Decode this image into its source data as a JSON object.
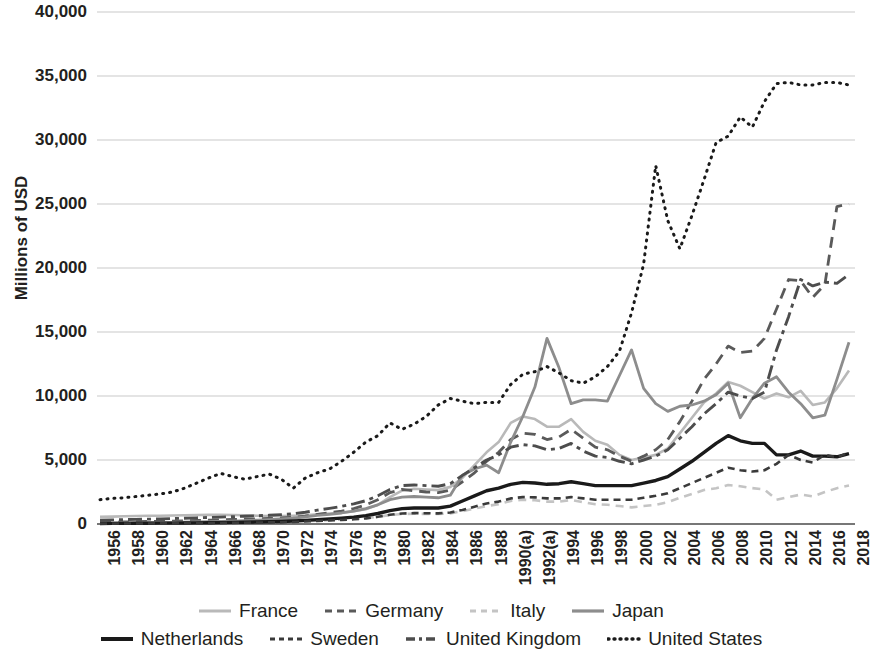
{
  "chart_data": {
    "type": "line",
    "title": "",
    "subtitle": "",
    "xlabel": "",
    "ylabel": "Millions of USD",
    "grid": true,
    "legend_position": "bottom",
    "ylim": [
      0,
      40000
    ],
    "ytick_step": 5000,
    "ytick_labels": [
      "40,000",
      "35,000",
      "30,000",
      "25,000",
      "20,000",
      "15,000",
      "10,000",
      "5,000",
      "0"
    ],
    "ytick_values": [
      40000,
      35000,
      30000,
      25000,
      20000,
      15000,
      10000,
      5000,
      0
    ],
    "x": [
      1956,
      1957,
      1958,
      1959,
      1960,
      1961,
      1962,
      1963,
      1964,
      1965,
      1966,
      1967,
      1968,
      1969,
      1970,
      1971,
      1972,
      1973,
      1974,
      1975,
      1976,
      1977,
      1978,
      1979,
      1980,
      1981,
      1982,
      1983,
      1984,
      1985,
      1986,
      1987,
      1988,
      1989,
      1990,
      1991,
      1992,
      1993,
      1994,
      1995,
      1996,
      1997,
      1998,
      1999,
      2000,
      2001,
      2002,
      2003,
      2004,
      2005,
      2006,
      2007,
      2008,
      2009,
      2010,
      2011,
      2012,
      2013,
      2014,
      2015,
      2016,
      2017,
      2018
    ],
    "xtick_labels": [
      "1956",
      "1958",
      "1960",
      "1962",
      "1964",
      "1966",
      "1968",
      "1970",
      "1972",
      "1974",
      "1976",
      "1978",
      "1980",
      "1982",
      "1984",
      "1986",
      "1988",
      "1990(a)",
      "1992(a)",
      "1994",
      "1996",
      "1998",
      "2000",
      "2002",
      "2004",
      "2006",
      "2008",
      "2010",
      "2012",
      "2014",
      "2016",
      "2018"
    ],
    "xtick_values": [
      1956,
      1958,
      1960,
      1962,
      1964,
      1966,
      1968,
      1970,
      1972,
      1974,
      1976,
      1978,
      1980,
      1982,
      1984,
      1986,
      1988,
      1990,
      1992,
      1994,
      1996,
      1998,
      2000,
      2002,
      2004,
      2006,
      2008,
      2010,
      2012,
      2014,
      2016,
      2018
    ],
    "series": [
      {
        "name": "France",
        "color": "#b9b9b9",
        "width": 2.6,
        "dash": "none",
        "values": [
          560,
          580,
          600,
          620,
          640,
          650,
          660,
          680,
          700,
          710,
          720,
          700,
          680,
          650,
          630,
          620,
          640,
          680,
          760,
          820,
          900,
          1000,
          1150,
          1500,
          2100,
          2600,
          2750,
          2700,
          2650,
          2900,
          3600,
          4600,
          5600,
          6400,
          7900,
          8400,
          8200,
          7600,
          7600,
          8200,
          7200,
          6500,
          6200,
          5400,
          5000,
          5200,
          5400,
          5900,
          7100,
          8300,
          9500,
          10200,
          11100,
          10800,
          10300,
          9800,
          10200,
          9900,
          10400,
          9300,
          9500,
          10600,
          12000
        ]
      },
      {
        "name": "Germany",
        "color": "#5a5a5a",
        "width": 2.8,
        "dash": "11,7",
        "values": [
          120,
          140,
          160,
          180,
          200,
          210,
          230,
          250,
          280,
          300,
          330,
          350,
          380,
          400,
          430,
          470,
          520,
          620,
          760,
          880,
          1000,
          1200,
          1500,
          1900,
          2450,
          2700,
          2600,
          2500,
          2450,
          2650,
          3300,
          4000,
          4900,
          5600,
          6600,
          7100,
          7000,
          6600,
          6800,
          7400,
          6700,
          6000,
          5800,
          5300,
          4900,
          5300,
          5800,
          6600,
          8000,
          9600,
          11300,
          12500,
          13900,
          13400,
          13500,
          14500,
          16800,
          19100,
          19000,
          17700,
          18700,
          24800,
          25000
        ]
      },
      {
        "name": "Italy",
        "color": "#c4c4c4",
        "width": 2.6,
        "dash": "8,6",
        "values": [
          60,
          65,
          70,
          75,
          80,
          85,
          90,
          95,
          100,
          110,
          120,
          130,
          140,
          150,
          160,
          175,
          190,
          220,
          260,
          300,
          340,
          390,
          450,
          560,
          700,
          780,
          800,
          790,
          780,
          830,
          1000,
          1200,
          1400,
          1550,
          1800,
          1900,
          1850,
          1750,
          1750,
          1880,
          1700,
          1550,
          1500,
          1400,
          1300,
          1400,
          1500,
          1700,
          2050,
          2350,
          2650,
          2800,
          3050,
          2950,
          2800,
          2700,
          1900,
          2100,
          2300,
          2150,
          2500,
          2800,
          3000
        ]
      },
      {
        "name": "Japan",
        "color": "#8d8d8d",
        "width": 2.8,
        "dash": "none",
        "values": [
          60,
          70,
          80,
          90,
          100,
          110,
          125,
          140,
          160,
          180,
          200,
          230,
          270,
          300,
          340,
          390,
          450,
          560,
          680,
          760,
          860,
          1000,
          1200,
          1500,
          1900,
          2100,
          2150,
          2100,
          2050,
          2250,
          3800,
          4300,
          4600,
          4000,
          6400,
          8400,
          10700,
          14500,
          12200,
          9400,
          9700,
          9700,
          9600,
          11600,
          13600,
          10600,
          9400,
          8800,
          9200,
          9300,
          9600,
          10100,
          11000,
          8300,
          9800,
          11000,
          11500,
          10300,
          9400,
          8300,
          8500,
          11300,
          14200
        ]
      },
      {
        "name": "Netherlands",
        "color": "#1a1a1a",
        "width": 3.4,
        "dash": "none",
        "values": [
          40,
          45,
          50,
          55,
          60,
          65,
          70,
          80,
          90,
          100,
          110,
          125,
          140,
          155,
          175,
          200,
          230,
          280,
          340,
          400,
          460,
          540,
          650,
          820,
          1050,
          1200,
          1250,
          1250,
          1250,
          1400,
          1800,
          2200,
          2600,
          2800,
          3100,
          3250,
          3200,
          3100,
          3150,
          3300,
          3150,
          3000,
          3000,
          3000,
          3000,
          3200,
          3400,
          3700,
          4300,
          4900,
          5600,
          6300,
          6900,
          6500,
          6300,
          6300,
          5400,
          5400,
          5700,
          5300,
          5300,
          5250,
          5500
        ]
      },
      {
        "name": "Sweden",
        "color": "#3a3a3a",
        "width": 2.6,
        "dash": "7,5",
        "values": [
          30,
          33,
          36,
          40,
          44,
          48,
          52,
          58,
          64,
          72,
          80,
          90,
          100,
          112,
          125,
          142,
          162,
          195,
          235,
          275,
          315,
          370,
          440,
          560,
          720,
          820,
          850,
          840,
          830,
          900,
          1100,
          1350,
          1600,
          1750,
          2000,
          2100,
          2080,
          2000,
          2000,
          2100,
          2000,
          1900,
          1900,
          1900,
          1900,
          2050,
          2200,
          2400,
          2800,
          3200,
          3600,
          4000,
          4400,
          4200,
          4100,
          4200,
          4700,
          5400,
          5000,
          4800,
          5400,
          5200,
          5600
        ]
      },
      {
        "name": "United Kingdom",
        "color": "#4d4d4d",
        "width": 2.9,
        "dash": "14,5,4,5",
        "values": [
          300,
          320,
          340,
          360,
          380,
          400,
          420,
          450,
          480,
          510,
          540,
          570,
          610,
          640,
          680,
          730,
          800,
          920,
          1080,
          1220,
          1380,
          1570,
          1820,
          2200,
          2700,
          3000,
          3050,
          3000,
          2950,
          3150,
          3800,
          4400,
          5000,
          5400,
          6000,
          6200,
          6100,
          5800,
          5900,
          6300,
          5700,
          5300,
          5200,
          4900,
          4700,
          5000,
          5300,
          5800,
          6700,
          7600,
          8600,
          9400,
          10300,
          10000,
          9800,
          10300,
          13600,
          16200,
          19100,
          18600,
          18900,
          18800,
          19500
        ]
      },
      {
        "name": "United States",
        "color": "#1a1a1a",
        "width": 3.0,
        "dash": "1,6",
        "values": [
          1900,
          2000,
          2050,
          2150,
          2250,
          2350,
          2500,
          2800,
          3200,
          3600,
          3950,
          3700,
          3500,
          3700,
          3900,
          3500,
          2800,
          3600,
          4000,
          4300,
          4900,
          5600,
          6400,
          6900,
          7900,
          7400,
          7800,
          8400,
          9300,
          9800,
          9600,
          9400,
          9500,
          9500,
          10900,
          11700,
          11900,
          12300,
          11800,
          11200,
          11000,
          11500,
          12300,
          13500,
          16500,
          20300,
          28000,
          23700,
          21500,
          24100,
          26900,
          29800,
          30300,
          31800,
          31000,
          33000,
          34400,
          34500,
          34300,
          34300,
          34500,
          34500,
          34300
        ]
      }
    ]
  },
  "axis": {
    "y_title": "Millions of USD"
  },
  "legend": {
    "row1": [
      {
        "label": "France",
        "style": "solid-light"
      },
      {
        "label": "Germany",
        "style": "dashed-dark"
      },
      {
        "label": "Italy",
        "style": "dashed-light"
      },
      {
        "label": "Japan",
        "style": "solid-gray"
      }
    ],
    "row2": [
      {
        "label": "Netherlands",
        "style": "solid-black-thick"
      },
      {
        "label": "Sweden",
        "style": "dashed-short"
      },
      {
        "label": "United Kingdom",
        "style": "dash-dot"
      },
      {
        "label": "United States",
        "style": "dotted"
      }
    ]
  }
}
